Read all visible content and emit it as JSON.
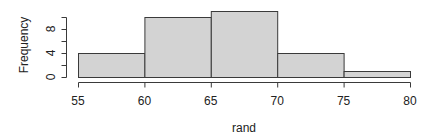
{
  "chart_data": {
    "type": "bar",
    "subtype": "histogram",
    "title": "",
    "xlabel": "rand",
    "ylabel": "Frequency",
    "bins": [
      {
        "start": 55,
        "end": 60,
        "count": 4
      },
      {
        "start": 60,
        "end": 65,
        "count": 10
      },
      {
        "start": 65,
        "end": 70,
        "count": 11
      },
      {
        "start": 70,
        "end": 75,
        "count": 4
      },
      {
        "start": 75,
        "end": 80,
        "count": 1
      }
    ],
    "categories": [
      "55-60",
      "60-65",
      "65-70",
      "70-75",
      "75-80"
    ],
    "values": [
      4,
      10,
      11,
      4,
      1
    ],
    "x_ticks": [
      55,
      60,
      65,
      70,
      75,
      80
    ],
    "y_ticks": [
      0,
      2,
      4,
      6,
      8,
      10
    ],
    "y_tick_labels": [
      "0",
      "",
      "4",
      "",
      "8",
      ""
    ],
    "xlim": [
      55,
      80
    ],
    "ylim": [
      0,
      11
    ],
    "grid": false,
    "legend": null,
    "colors": {
      "bar_fill": "#d3d3d3",
      "bar_stroke": "#3a3a3a"
    }
  }
}
